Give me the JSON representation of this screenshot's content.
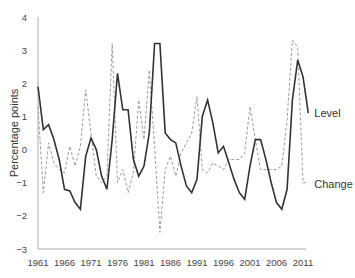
{
  "chart_data": {
    "type": "line",
    "title": "",
    "xlabel": "",
    "ylabel": "Percentage points",
    "ylim": [
      -3,
      4
    ],
    "yticks": [
      -3,
      -2,
      -1,
      0,
      1,
      2,
      3,
      4
    ],
    "xticks": [
      1961,
      1966,
      1971,
      1976,
      1981,
      1986,
      1991,
      1996,
      2001,
      2006,
      2011
    ],
    "grid": false,
    "legend_position": "inline-right",
    "x": [
      1961,
      1962,
      1963,
      1964,
      1965,
      1966,
      1967,
      1968,
      1969,
      1970,
      1971,
      1972,
      1973,
      1974,
      1975,
      1976,
      1977,
      1978,
      1979,
      1980,
      1981,
      1982,
      1983,
      1984,
      1985,
      1986,
      1987,
      1988,
      1989,
      1990,
      1991,
      1992,
      1993,
      1994,
      1995,
      1996,
      1997,
      1998,
      1999,
      2000,
      2001,
      2002,
      2003,
      2004,
      2005,
      2006,
      2007,
      2008,
      2009,
      2010,
      2011,
      2012
    ],
    "series": [
      {
        "name": "Level",
        "style": "solid",
        "color": "#333333",
        "values": [
          1.9,
          0.6,
          0.75,
          0.3,
          -0.3,
          -1.2,
          -1.25,
          -1.6,
          -1.8,
          -0.2,
          0.35,
          0.0,
          -0.8,
          -1.2,
          0.3,
          2.3,
          1.2,
          1.2,
          -0.3,
          -0.8,
          -0.5,
          0.5,
          3.2,
          3.2,
          0.5,
          0.3,
          0.2,
          -0.5,
          -1.1,
          -1.3,
          -0.9,
          1.0,
          1.5,
          0.8,
          -0.1,
          0.1,
          -0.4,
          -0.9,
          -1.3,
          -1.5,
          -0.5,
          0.3,
          0.3,
          -0.3,
          -1.0,
          -1.6,
          -1.8,
          -1.2,
          1.5,
          2.7,
          2.2,
          1.1
        ]
      },
      {
        "name": "Change",
        "style": "dashed",
        "color": "#999999",
        "values": [
          1.3,
          -1.3,
          0.2,
          -0.4,
          -0.6,
          -0.7,
          0.1,
          -0.5,
          0.1,
          1.8,
          0.5,
          -0.8,
          -1.0,
          -0.8,
          3.2,
          -1.0,
          -0.6,
          -1.3,
          -0.7,
          1.5,
          0.3,
          2.4,
          0.1,
          -2.5,
          -0.6,
          -0.2,
          -0.8,
          -0.1,
          0.2,
          0.5,
          1.6,
          -0.6,
          -0.7,
          -0.4,
          -0.5,
          -0.6,
          -0.3,
          -0.3,
          -0.3,
          -0.1,
          1.3,
          0.3,
          -0.6,
          -0.6,
          -0.6,
          -0.6,
          -0.5,
          0.9,
          3.3,
          3.1,
          -1.0,
          -1.0
        ]
      }
    ],
    "annotations": [
      {
        "text": "Level",
        "series": "Level"
      },
      {
        "text": "Change",
        "series": "Change"
      }
    ]
  },
  "labels": {
    "ylabel": "Percentage points",
    "level": "Level",
    "change": "Change"
  }
}
